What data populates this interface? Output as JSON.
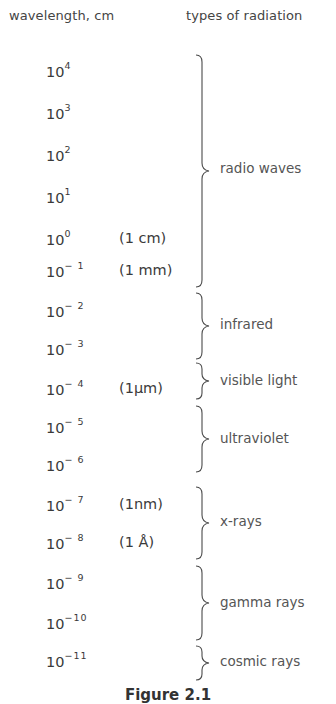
{
  "header": {
    "left": "wavelength, cm",
    "right": "types of radiation"
  },
  "rows": [
    {
      "base": "10",
      "exp": "4",
      "note": ""
    },
    {
      "base": "10",
      "exp": "3",
      "note": ""
    },
    {
      "base": "10",
      "exp": "2",
      "note": ""
    },
    {
      "base": "10",
      "exp": "1",
      "note": ""
    },
    {
      "base": "10",
      "exp": "0",
      "note": "(1 cm)"
    },
    {
      "base": "10",
      "exp": "− 1",
      "note": "(1 mm)"
    },
    {
      "base": "10",
      "exp": "− 2",
      "note": ""
    },
    {
      "base": "10",
      "exp": "− 3",
      "note": ""
    },
    {
      "base": "10",
      "exp": "− 4",
      "note": "(1μm)"
    },
    {
      "base": "10",
      "exp": "− 5",
      "note": ""
    },
    {
      "base": "10",
      "exp": "− 6",
      "note": ""
    },
    {
      "base": "10",
      "exp": "− 7",
      "note": "(1nm)"
    },
    {
      "base": "10",
      "exp": "− 8",
      "note": "(1 Å)"
    },
    {
      "base": "10",
      "exp": "− 9",
      "note": ""
    },
    {
      "base": "10",
      "exp": "−10",
      "note": ""
    },
    {
      "base": "10",
      "exp": "−11",
      "note": ""
    }
  ],
  "types": [
    {
      "label": "radio waves",
      "from_exp": 4,
      "to_exp": -1
    },
    {
      "label": "infrared",
      "from_exp": -2,
      "to_exp": -3
    },
    {
      "label": "visible light",
      "from_exp": -4,
      "to_exp": -4
    },
    {
      "label": "ultraviolet",
      "from_exp": -5,
      "to_exp": -6
    },
    {
      "label": "x-rays",
      "from_exp": -7,
      "to_exp": -8
    },
    {
      "label": "gamma rays",
      "from_exp": -9,
      "to_exp": -10
    },
    {
      "label": "cosmic rays",
      "from_exp": -11,
      "to_exp": -11
    }
  ],
  "caption": "Figure 2.1"
}
